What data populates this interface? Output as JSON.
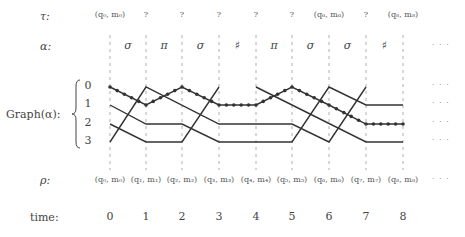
{
  "rows": {
    "tau": {
      "label": "τ:",
      "y": 17
    },
    "alpha": {
      "label": "α:",
      "y": 47
    },
    "graph": {
      "label": "Graph(α):",
      "y": 116
    },
    "rho": {
      "label": "ρ:",
      "y": 181
    },
    "time": {
      "label": "time:",
      "y": 218
    }
  },
  "columns_x": [
    110,
    146,
    182,
    219,
    256,
    292,
    329,
    366,
    403
  ],
  "boundaries_x": [
    110,
    146,
    182,
    219,
    256,
    292,
    329,
    366,
    403
  ],
  "row_y": [
    87,
    105,
    124,
    142
  ],
  "graph_row_labels": [
    "0",
    "1",
    "2",
    "3"
  ],
  "tau": [
    "(q₀, m₀)",
    "?",
    "?",
    "?",
    "?",
    "?",
    "(q₆, m₆)",
    "?",
    "(q₈, m₈)"
  ],
  "alpha": [
    "σ",
    "π",
    "σ",
    "♯",
    "π",
    "σ",
    "σ",
    "♯"
  ],
  "rho": [
    "(q₀, m₀)",
    "(q₁, m₁)",
    "(q₂, m₂)",
    "(q₃, m₃)",
    "(q₄, m₄)",
    "(q₅, m₅)",
    "(q₆, m₆)",
    "(q₇, m₇)",
    "(q₈, m₈)"
  ],
  "time": [
    "0",
    "1",
    "2",
    "3",
    "4",
    "5",
    "6",
    "7",
    "8"
  ],
  "ellipsis": "· · ·",
  "paths": [
    {
      "name": "dotted-path",
      "dotted": true,
      "points": [
        [
          0,
          0
        ],
        [
          1,
          1
        ],
        [
          2,
          0
        ],
        [
          3,
          1
        ],
        [
          4,
          1
        ],
        [
          5,
          0
        ],
        [
          6,
          1
        ],
        [
          7,
          2
        ],
        [
          8,
          2
        ]
      ]
    },
    {
      "name": "path-a",
      "dotted": false,
      "points": [
        [
          0,
          3
        ],
        [
          1,
          0
        ],
        [
          3,
          2
        ],
        [
          5,
          2
        ],
        [
          6,
          3
        ],
        [
          7,
          0
        ]
      ]
    },
    {
      "name": "path-b",
      "dotted": false,
      "points": [
        [
          0,
          1
        ],
        [
          1,
          2
        ],
        [
          2,
          2
        ],
        [
          3,
          3
        ],
        [
          5,
          3
        ],
        [
          6,
          0
        ],
        [
          7,
          1
        ],
        [
          8,
          1
        ]
      ]
    },
    {
      "name": "path-c",
      "dotted": false,
      "points": [
        [
          0,
          2
        ],
        [
          1,
          3
        ],
        [
          2,
          3
        ],
        [
          3,
          0
        ]
      ]
    },
    {
      "name": "path-d",
      "dotted": false,
      "points": [
        [
          4,
          0
        ],
        [
          7,
          3
        ],
        [
          8,
          3
        ]
      ]
    }
  ],
  "colors": {
    "line": "#333333",
    "dash": "#999999",
    "dot": "#333333"
  }
}
